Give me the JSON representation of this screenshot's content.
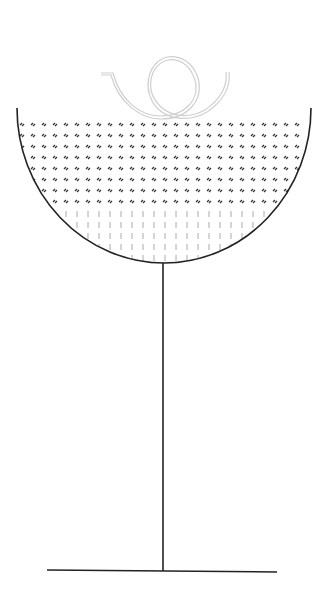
{
  "figure": {
    "width": 318,
    "height": 610,
    "background": "#ffffff"
  },
  "colors": {
    "outline": "#222222",
    "curl": "#cfcfcf",
    "dot_pattern": "#333333",
    "dash_pattern": "#aaaaaa"
  },
  "glass": {
    "bowl": {
      "left_x": 17,
      "right_x": 311,
      "rim_y": 108,
      "bottom_y": 263
    },
    "stem": {
      "x": 163,
      "top_y": 263,
      "bottom_y": 571
    },
    "base": {
      "x1": 47,
      "y1": 570,
      "x2": 277,
      "y2": 572
    }
  },
  "liquid": {
    "dot_rows": [
      124,
      135,
      146,
      157,
      168,
      179,
      190,
      201
    ],
    "dash_rows": [
      214,
      225,
      236,
      247,
      258
    ],
    "col_start": 22,
    "col_step": 11,
    "col_end": 306
  },
  "garnish": {
    "type": "spiral-curl",
    "stroke": "double line"
  }
}
